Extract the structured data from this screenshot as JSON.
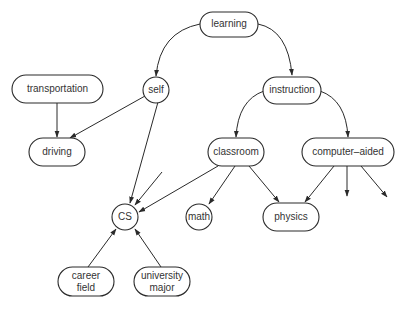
{
  "nodes": {
    "learning": {
      "label": "learning",
      "shape": "pill"
    },
    "self": {
      "label": "self",
      "shape": "circle"
    },
    "instruction": {
      "label": "instruction",
      "shape": "pill"
    },
    "transportation": {
      "label": "transportation",
      "shape": "pill"
    },
    "driving": {
      "label": "driving",
      "shape": "pill"
    },
    "classroom": {
      "label": "classroom",
      "shape": "pill"
    },
    "computer_aided": {
      "label": "computer–aided",
      "shape": "pill"
    },
    "cs": {
      "label": "CS",
      "shape": "circle"
    },
    "math": {
      "label": "math",
      "shape": "circle"
    },
    "physics": {
      "label": "physics",
      "shape": "pill"
    },
    "career_field": {
      "label_line1": "career",
      "label_line2": "field",
      "shape": "pill"
    },
    "university_major": {
      "label_line1": "university",
      "label_line2": "major",
      "shape": "pill"
    }
  },
  "edges": [
    {
      "from": "learning",
      "to": "self"
    },
    {
      "from": "learning",
      "to": "instruction"
    },
    {
      "from": "transportation",
      "to": "driving"
    },
    {
      "from": "self",
      "to": "driving"
    },
    {
      "from": "self",
      "to": "cs"
    },
    {
      "from": "instruction",
      "to": "classroom"
    },
    {
      "from": "instruction",
      "to": "computer_aided"
    },
    {
      "from": "classroom",
      "to": "cs"
    },
    {
      "from": "classroom",
      "to": "math"
    },
    {
      "from": "classroom",
      "to": "physics"
    },
    {
      "from": "computer_aided",
      "to": "physics"
    },
    {
      "from": "computer_aided",
      "to": "(unlabeled)"
    },
    {
      "from": "computer_aided",
      "to": "(unlabeled)"
    },
    {
      "from": "(unlabeled)",
      "to": "cs"
    },
    {
      "from": "career_field",
      "to": "cs"
    },
    {
      "from": "university_major",
      "to": "cs"
    }
  ]
}
